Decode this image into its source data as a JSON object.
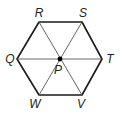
{
  "figure": {
    "type": "regular-hexagon",
    "colors": {
      "outline": "#1a1a1a",
      "diagonal": "#555555",
      "center_dot": "#000000"
    },
    "vertices": [
      {
        "name": "R",
        "x": 39,
        "y": 22,
        "label_x": 39,
        "label_y": 13
      },
      {
        "name": "S",
        "x": 82,
        "y": 22,
        "label_x": 83,
        "label_y": 13
      },
      {
        "name": "T",
        "x": 102,
        "y": 59,
        "label_x": 110,
        "label_y": 59
      },
      {
        "name": "V",
        "x": 82,
        "y": 95,
        "label_x": 81,
        "label_y": 104
      },
      {
        "name": "W",
        "x": 39,
        "y": 95,
        "label_x": 35,
        "label_y": 104
      },
      {
        "name": "Q",
        "x": 17,
        "y": 59,
        "label_x": 10,
        "label_y": 59
      }
    ],
    "center": {
      "name": "P",
      "x": 60,
      "y": 59,
      "label_x": 58,
      "label_y": 70
    },
    "diagonals": [
      [
        "R",
        "V"
      ],
      [
        "S",
        "W"
      ],
      [
        "Q",
        "T"
      ]
    ]
  }
}
